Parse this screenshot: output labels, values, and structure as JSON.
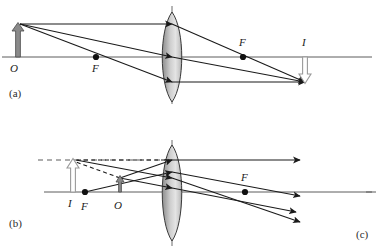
{
  "figure": {
    "panels": [
      {
        "id": "a",
        "label": "(a)",
        "case": "real inverted image",
        "object_label": "O",
        "image_label": "I",
        "focal_label_left": "F",
        "focal_label_right": "F",
        "lens_type": "biconvex converging lens",
        "ray_count": 3,
        "object_arrow_direction": "up",
        "image_arrow_direction": "down",
        "axis_y": 57,
        "lens_x": 172,
        "object_x": 18,
        "image_x": 305,
        "focal_left_x": 96,
        "focal_right_x": 243
      },
      {
        "id": "b",
        "label": "(b)",
        "case": "virtual upright magnified image",
        "object_label": "O",
        "image_label": "I",
        "focal_label_left": "F",
        "focal_label_right": "F",
        "lens_type": "biconvex converging lens",
        "ray_count": 3,
        "object_arrow_direction": "up",
        "image_arrow_direction": "up",
        "axis_y": 192,
        "lens_x": 172,
        "object_x": 120,
        "image_x": 73,
        "focal_left_x": 85,
        "focal_right_x": 245
      },
      {
        "id": "c",
        "label": "(c)",
        "case": "cropped panel label only"
      }
    ],
    "colors": {
      "ray_stroke": "#1a1a1a",
      "axis_stroke": "#5d5d5d",
      "lens_edge": "#3a3a3a",
      "lens_fill_light": "#e8e8e8",
      "lens_fill_dark": "#8f8f8f",
      "object_arrow_fill": "#8a8a8a",
      "image_arrow_fill": "#ffffff",
      "image_arrow_stroke": "#9a9a9a",
      "focal_dot": "#111111",
      "label_text": "#1a1a1a"
    }
  }
}
